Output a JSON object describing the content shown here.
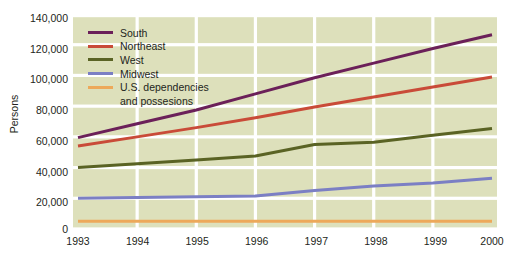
{
  "chart_data": {
    "type": "line",
    "title": "",
    "xlabel": "",
    "ylabel": "Persons",
    "x": [
      1993,
      1994,
      1995,
      1996,
      1997,
      1998,
      1999,
      2000
    ],
    "categories": [
      "1993",
      "1994",
      "1995",
      "1996",
      "1997",
      "1998",
      "1999",
      "2000"
    ],
    "xlim": [
      1993,
      2000
    ],
    "ylim": [
      0,
      140000
    ],
    "ytick_values": [
      0,
      20000,
      40000,
      60000,
      80000,
      100000,
      120000,
      140000
    ],
    "ytick_labels": [
      "0",
      "20,000",
      "40,000",
      "60,000",
      "80,000",
      "100,000",
      "120,000",
      "140,000"
    ],
    "grid": true,
    "grid_color": "#ffffff",
    "plot_background": "#dde0bb",
    "legend_position": "upper-left-inside",
    "series": [
      {
        "name": "South",
        "color": "#6b2059",
        "values": [
          59500,
          68500,
          77500,
          88000,
          98500,
          108000,
          117500,
          126500
        ]
      },
      {
        "name": "Northeast",
        "color": "#c94b38",
        "values": [
          54000,
          60000,
          66000,
          72500,
          79500,
          86000,
          92500,
          99000
        ]
      },
      {
        "name": "West",
        "color": "#5a6324",
        "values": [
          40000,
          42500,
          45000,
          47500,
          55000,
          56500,
          61000,
          65500
        ]
      },
      {
        "name": "Midwest",
        "color": "#7b7fc4",
        "values": [
          20000,
          20500,
          21000,
          21500,
          25000,
          28000,
          30000,
          33000
        ]
      },
      {
        "name": "U.S. dependencies and possesions",
        "color": "#eda95a",
        "values": [
          5000,
          5000,
          5000,
          5000,
          5000,
          5000,
          5000,
          5000
        ]
      }
    ]
  },
  "axis": {
    "y_title": "Persons"
  },
  "legend": {
    "items": [
      {
        "label": "South",
        "color": "#6b2059"
      },
      {
        "label": "Northeast",
        "color": "#c94b38"
      },
      {
        "label": "West",
        "color": "#5a6324"
      },
      {
        "label": "Midwest",
        "color": "#7b7fc4"
      },
      {
        "label": "U.S. dependencies",
        "label_line2": "and possesions",
        "color": "#eda95a"
      }
    ]
  }
}
